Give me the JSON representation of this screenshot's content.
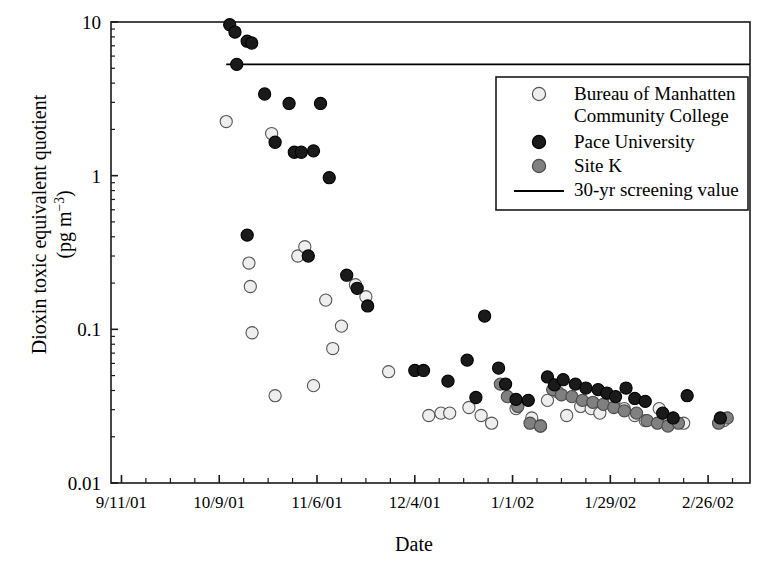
{
  "chart_data": {
    "type": "scatter",
    "title": "",
    "xlabel": "Date",
    "ylabel_line1": "Dioxin toxic equivalent quotient",
    "ylabel_line2_pre": "(pg m",
    "ylabel_line2_sup": "−3",
    "ylabel_line2_post": ")",
    "yscale": "log",
    "ylim": [
      0.01,
      10
    ],
    "yticks": [
      0.01,
      0.1,
      1,
      10
    ],
    "ytick_labels": [
      "0.01",
      "0.1",
      "1",
      "10"
    ],
    "xtick_labels": [
      "9/11/01",
      "10/9/01",
      "11/6/01",
      "12/4/01",
      "1/1/02",
      "1/29/02",
      "2/26/02"
    ],
    "xtick_days": [
      0,
      28,
      56,
      84,
      112,
      140,
      168
    ],
    "xlim_days": [
      -3,
      180
    ],
    "x_minor_interval_days": 7,
    "grid": false,
    "legend_position": "upper right",
    "reference_line": {
      "label": "30-yr screening value",
      "value": 5.3,
      "start_day": 30,
      "end_day": 180,
      "color": "#000000"
    },
    "series": [
      {
        "name": "Bureau of Manhatten Community College",
        "legend_label_line1": "Bureau of Manhatten",
        "legend_label_line2": "Community College",
        "marker": "circle",
        "fill": "#eeeeee",
        "edge": "#555555",
        "points": [
          [
            30.0,
            2.25
          ],
          [
            36.5,
            0.27
          ],
          [
            36.9,
            0.19
          ],
          [
            37.4,
            0.095
          ],
          [
            43.0,
            1.88
          ],
          [
            44.0,
            0.037
          ],
          [
            50.5,
            0.3
          ],
          [
            52.5,
            0.345
          ],
          [
            55.0,
            0.043
          ],
          [
            58.5,
            0.155
          ],
          [
            60.5,
            0.075
          ],
          [
            63.0,
            0.105
          ],
          [
            67.0,
            0.195
          ],
          [
            70.0,
            0.163
          ],
          [
            76.5,
            0.053
          ],
          [
            88.0,
            0.0275
          ],
          [
            91.5,
            0.0285
          ],
          [
            94.0,
            0.0285
          ],
          [
            99.5,
            0.031
          ],
          [
            103.0,
            0.0275
          ],
          [
            106.0,
            0.0245
          ],
          [
            113.0,
            0.0305
          ],
          [
            117.5,
            0.0265
          ],
          [
            120.0,
            0.0235
          ],
          [
            122.0,
            0.0345
          ],
          [
            125.0,
            0.039
          ],
          [
            127.5,
            0.0275
          ],
          [
            131.5,
            0.0315
          ],
          [
            134.5,
            0.0305
          ],
          [
            137.0,
            0.0285
          ],
          [
            141.0,
            0.0335
          ],
          [
            144.0,
            0.0305
          ],
          [
            147.0,
            0.0275
          ],
          [
            150.0,
            0.0255
          ],
          [
            154.0,
            0.0305
          ],
          [
            157.0,
            0.0255
          ],
          [
            161.0,
            0.0245
          ],
          [
            172.5,
            0.0255
          ]
        ]
      },
      {
        "name": "Pace University",
        "legend_label_line1": "Pace University",
        "marker": "circle",
        "fill": "#1a1a1a",
        "edge": "#000000",
        "points": [
          [
            31.0,
            9.6
          ],
          [
            32.5,
            8.6
          ],
          [
            36.0,
            7.5
          ],
          [
            37.3,
            7.3
          ],
          [
            33.0,
            5.3
          ],
          [
            41.0,
            3.4
          ],
          [
            48.0,
            2.95
          ],
          [
            44.0,
            1.65
          ],
          [
            49.5,
            1.42
          ],
          [
            51.5,
            1.42
          ],
          [
            55.0,
            1.45
          ],
          [
            57.0,
            2.95
          ],
          [
            59.5,
            0.97
          ],
          [
            36.0,
            0.41
          ],
          [
            53.5,
            0.3
          ],
          [
            64.5,
            0.225
          ],
          [
            67.5,
            0.185
          ],
          [
            70.5,
            0.142
          ],
          [
            84.0,
            0.054
          ],
          [
            86.5,
            0.054
          ],
          [
            93.5,
            0.046
          ],
          [
            99.0,
            0.063
          ],
          [
            104.0,
            0.122
          ],
          [
            101.5,
            0.036
          ],
          [
            108.0,
            0.056
          ],
          [
            110.0,
            0.044
          ],
          [
            113.0,
            0.035
          ],
          [
            116.5,
            0.0345
          ],
          [
            122.0,
            0.049
          ],
          [
            124.0,
            0.0435
          ],
          [
            126.5,
            0.047
          ],
          [
            130.0,
            0.044
          ],
          [
            133.0,
            0.0415
          ],
          [
            136.5,
            0.0405
          ],
          [
            139.0,
            0.0385
          ],
          [
            141.5,
            0.0365
          ],
          [
            144.5,
            0.0415
          ],
          [
            147.0,
            0.0355
          ],
          [
            150.0,
            0.034
          ],
          [
            155.0,
            0.0285
          ],
          [
            158.0,
            0.0265
          ],
          [
            162.0,
            0.037
          ],
          [
            171.5,
            0.0265
          ]
        ]
      },
      {
        "name": "Site K",
        "legend_label_line1": "Site K",
        "marker": "circle",
        "fill": "#808080",
        "edge": "#4a4a4a",
        "points": [
          [
            108.5,
            0.044
          ],
          [
            110.5,
            0.0365
          ],
          [
            113.5,
            0.0315
          ],
          [
            117.0,
            0.0245
          ],
          [
            120.0,
            0.0235
          ],
          [
            123.5,
            0.0405
          ],
          [
            126.0,
            0.0375
          ],
          [
            129.0,
            0.0365
          ],
          [
            132.0,
            0.0345
          ],
          [
            135.0,
            0.0335
          ],
          [
            138.0,
            0.0325
          ],
          [
            141.0,
            0.031
          ],
          [
            144.0,
            0.0295
          ],
          [
            147.5,
            0.0285
          ],
          [
            150.5,
            0.0255
          ],
          [
            153.5,
            0.0245
          ],
          [
            156.5,
            0.0235
          ],
          [
            159.5,
            0.0245
          ],
          [
            171.0,
            0.0245
          ],
          [
            173.5,
            0.0265
          ]
        ]
      }
    ]
  },
  "legend": {
    "items": [
      {
        "marker": "light-circle",
        "label": "Bureau of Manhatten",
        "label2": "Community College"
      },
      {
        "marker": "dark-circle",
        "label": "Pace University"
      },
      {
        "marker": "gray-circle",
        "label": "Site K"
      },
      {
        "marker": "line",
        "label": "30-yr screening value"
      }
    ]
  }
}
